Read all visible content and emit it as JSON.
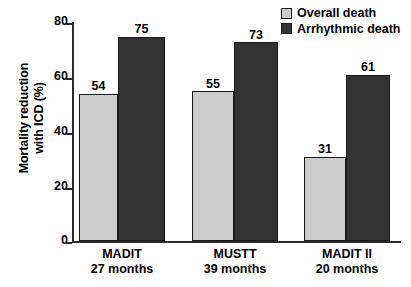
{
  "chart_data": {
    "type": "bar",
    "title": "",
    "xlabel": "",
    "ylabel": "Mortality reduction with ICD (%)",
    "ylabel_lines": [
      "Mortality reduction",
      "with ICD (%)"
    ],
    "ylim": [
      0,
      80
    ],
    "ytick_labels": [
      "80",
      "60",
      "40",
      "20",
      "0"
    ],
    "ytick_values": [
      80,
      60,
      40,
      20,
      0
    ],
    "grid": false,
    "legend_position": "top-right",
    "categories": [
      "MADIT",
      "MUSTT",
      "MADIT II"
    ],
    "category_sublabels": [
      "27 months",
      "39 months",
      "20 months"
    ],
    "series": [
      {
        "name": "Overall death",
        "color": "#cccccc",
        "values": [
          54,
          55,
          31
        ]
      },
      {
        "name": "Arrhythmic death",
        "color": "#333333",
        "values": [
          75,
          73,
          61
        ]
      }
    ]
  },
  "legend": {
    "items": [
      {
        "label": "Overall death",
        "swatch_color": "#cccccc"
      },
      {
        "label": "Arrhythmic death",
        "swatch_color": "#333333"
      }
    ]
  },
  "axis": {
    "y_title_line1": "Mortality reduction",
    "y_title_line2": "with ICD (%)",
    "y_ticks": [
      "80",
      "60",
      "40",
      "20",
      "0"
    ]
  },
  "bars": [
    {
      "value_label": "54",
      "series": "Overall death",
      "category": "MADIT"
    },
    {
      "value_label": "75",
      "series": "Arrhythmic death",
      "category": "MADIT"
    },
    {
      "value_label": "55",
      "series": "Overall death",
      "category": "MUSTT"
    },
    {
      "value_label": "73",
      "series": "Arrhythmic death",
      "category": "MUSTT"
    },
    {
      "value_label": "31",
      "series": "Overall death",
      "category": "MADIT II"
    },
    {
      "value_label": "61",
      "series": "Arrhythmic death",
      "category": "MADIT II"
    }
  ],
  "categories": [
    {
      "name": "MADIT",
      "sublabel": "27 months"
    },
    {
      "name": "MUSTT",
      "sublabel": "39 months"
    },
    {
      "name": "MADIT II",
      "sublabel": "20 months"
    }
  ]
}
